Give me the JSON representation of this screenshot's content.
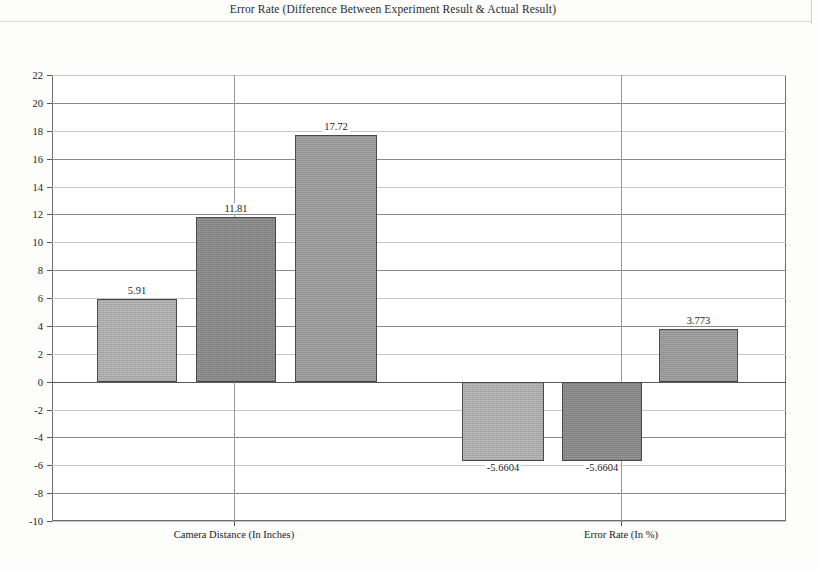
{
  "document": {
    "title": "Error Rate (Difference Between Experiment Result & Actual Result)"
  },
  "chart_data": {
    "type": "bar",
    "title": "Error Rate (Difference Between Experiment Result & Actual Result)",
    "xlabel": "",
    "ylabel": "",
    "ylim": [
      -10,
      22
    ],
    "ytick_step": 2,
    "grid": true,
    "legend": "none",
    "categories": [
      "Camera Distance (In Inches)",
      "Error Rate (In %)"
    ],
    "yticks": [
      "22",
      "20",
      "18",
      "16",
      "14",
      "12",
      "10",
      "8",
      "6",
      "4",
      "2",
      "0",
      "-2",
      "-4",
      "-6",
      "-8",
      "-10"
    ],
    "series": [
      {
        "name": "Series 1",
        "color": "#b3b3b3",
        "values": [
          5.91,
          -5.6604
        ],
        "labels": [
          "5.91",
          "-5.6604"
        ]
      },
      {
        "name": "Series 2",
        "color": "#8f8f8f",
        "values": [
          11.81,
          -5.6604
        ],
        "labels": [
          "11.81",
          "-5.6604"
        ]
      },
      {
        "name": "Series 3",
        "color": "#a5a5a5",
        "values": [
          17.72,
          3.773
        ],
        "labels": [
          "17.72",
          "3.773"
        ]
      }
    ],
    "bars": [
      {
        "label": "5.91",
        "value": 5.91,
        "group": "Camera Distance (In Inches)",
        "series": "Series 1",
        "color": "#b5b5b5",
        "x": 45,
        "w": 80,
        "label_align": "above"
      },
      {
        "label": "11.81",
        "value": 11.81,
        "group": "Camera Distance (In Inches)",
        "series": "Series 2",
        "color": "#8d8d8d",
        "x": 144,
        "w": 80,
        "label_align": "above"
      },
      {
        "label": "17.72",
        "value": 17.72,
        "group": "Camera Distance (In Inches)",
        "series": "Series 3",
        "color": "#a0a0a0",
        "x": 243,
        "w": 82,
        "label_align": "above"
      },
      {
        "label": "-5.6604",
        "value": -5.6604,
        "group": "Error Rate (In %)",
        "series": "Series 1",
        "color": "#b5b5b5",
        "x": 410,
        "w": 82,
        "label_align": "below"
      },
      {
        "label": "-5.6604",
        "value": -5.6604,
        "group": "Error Rate (In %)",
        "series": "Series 2",
        "color": "#8d8d8d",
        "x": 510,
        "w": 80,
        "label_align": "below"
      },
      {
        "label": "3.773",
        "value": 3.773,
        "group": "Error Rate (In %)",
        "series": "Series 3",
        "color": "#a0a0a0",
        "x": 607,
        "w": 79,
        "label_align": "above"
      }
    ],
    "category_tick_positions": [
      182,
      569
    ]
  }
}
